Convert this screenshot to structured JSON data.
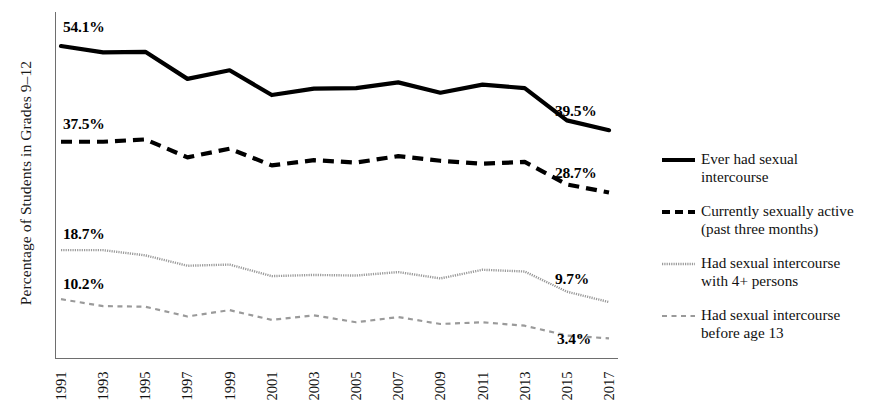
{
  "figure": {
    "ylabel": "Percentage of Students in Grades 9–12"
  },
  "legend": {
    "items": [
      {
        "marker": "solid-thick-black-line-icon",
        "line1": "Ever had sexual",
        "line2": "intercourse"
      },
      {
        "marker": "dashed-thick-black-line-icon",
        "line1": "Currently sexually active",
        "line2": "(past three months)"
      },
      {
        "marker": "dotted-thin-gray-line-icon",
        "line1": "Had sexual intercourse",
        "line2": "with 4+ persons"
      },
      {
        "marker": "dashed-thin-gray-line-icon",
        "line1": "Had sexual intercourse",
        "line2": "before age 13"
      }
    ]
  },
  "annotations": {
    "left": [
      {
        "text": "54.1%",
        "series": "ever-had-sexual-intercourse"
      },
      {
        "text": "37.5%",
        "series": "currently-sexually-active"
      },
      {
        "text": "18.7%",
        "series": "four-plus-persons"
      },
      {
        "text": "10.2%",
        "series": "before-age-13"
      }
    ],
    "right": [
      {
        "text": "39.5%",
        "series": "ever-had-sexual-intercourse"
      },
      {
        "text": "28.7%",
        "series": "currently-sexually-active"
      },
      {
        "text": "9.7%",
        "series": "four-plus-persons"
      },
      {
        "text": "3.4%",
        "series": "before-age-13"
      }
    ]
  },
  "chart_data": {
    "type": "line",
    "title": "",
    "xlabel": "",
    "ylabel": "Percentage of Students in Grades 9–12",
    "grid": false,
    "legend_position": "right",
    "xlim": [
      1991,
      2017
    ],
    "ylim": [
      0,
      60
    ],
    "x": [
      1991,
      1993,
      1995,
      1997,
      1999,
      2001,
      2003,
      2005,
      2007,
      2009,
      2011,
      2013,
      2015,
      2017
    ],
    "categories": [
      "1991",
      "1993",
      "1995",
      "1997",
      "1999",
      "2001",
      "2003",
      "2005",
      "2007",
      "2009",
      "2011",
      "2013",
      "2015",
      "2017"
    ],
    "series": [
      {
        "name": "Ever had sexual intercourse",
        "style": "solid-thick-black",
        "color": "#000000",
        "values": [
          54.1,
          53.0,
          53.1,
          48.4,
          49.9,
          45.6,
          46.7,
          46.8,
          47.8,
          46.0,
          47.4,
          46.8,
          41.2,
          39.5
        ],
        "label_start": "54.1%",
        "label_end": "39.5%"
      },
      {
        "name": "Currently sexually active (past three months)",
        "style": "dashed-thick-black",
        "color": "#000000",
        "values": [
          37.5,
          37.5,
          37.9,
          34.8,
          36.3,
          33.4,
          34.3,
          33.9,
          35.0,
          34.2,
          33.7,
          34.0,
          30.1,
          28.7
        ],
        "label_start": "37.5%",
        "label_end": "28.7%"
      },
      {
        "name": "Had sexual intercourse with 4+ persons",
        "style": "dotted-thin-gray",
        "color": "#9a9a9a",
        "values": [
          18.7,
          18.7,
          17.8,
          16.0,
          16.2,
          14.2,
          14.4,
          14.3,
          14.9,
          13.8,
          15.3,
          15.0,
          11.5,
          9.7
        ],
        "label_start": "18.7%",
        "label_end": "9.7%"
      },
      {
        "name": "Had sexual intercourse before age 13",
        "style": "dashed-thin-gray",
        "color": "#9a9a9a",
        "values": [
          10.2,
          9.0,
          8.9,
          7.2,
          8.3,
          6.6,
          7.4,
          6.2,
          7.1,
          5.9,
          6.2,
          5.6,
          3.9,
          3.4
        ],
        "label_start": "10.2%",
        "label_end": "3.4%"
      }
    ]
  }
}
